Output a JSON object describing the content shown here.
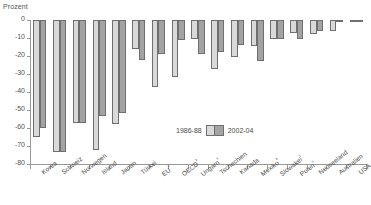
{
  "axis_title": "Prozent",
  "legend": {
    "series1_label": "1986-88",
    "series2_label": "2002-04",
    "series1_color": "#d9d9d9",
    "series2_color": "#a3a3a3"
  },
  "chart_data": {
    "type": "bar",
    "title": "",
    "subtitle": "",
    "xlabel": "",
    "ylabel": "Prozent",
    "ylim": [
      -80,
      0
    ],
    "ytick_labels": [
      "0",
      "-10",
      "-20",
      "-30",
      "-40",
      "-50",
      "-60",
      "-70",
      "-80"
    ],
    "ytick_values": [
      0,
      -10,
      -20,
      -30,
      -40,
      -50,
      -60,
      -70,
      -80
    ],
    "grid": false,
    "legend_position": "inside-bottom-center",
    "categories": [
      "Korea",
      "Schweiz",
      "Norwegen",
      "Island",
      "Japan",
      "Türkei",
      "EU ²",
      "OECD ³",
      "Ungarn ¹",
      "Tschechien",
      "Kanada",
      "Mexiko ³",
      "Slowakei ¹",
      "Polen ¹",
      "Neuseeland",
      "Australien",
      "USA"
    ],
    "series": [
      {
        "name": "1986-88",
        "color": "#d9d9d9",
        "values": [
          -65,
          -73.5,
          -57,
          -72,
          -57.5,
          -16,
          -37,
          -31.5,
          -10.5,
          -27,
          -20.5,
          -14.5,
          -10.5,
          -7,
          -8,
          -6,
          -1
        ]
      },
      {
        "name": "2002-04",
        "color": "#a3a3a3",
        "values": [
          -60,
          -73.5,
          -57,
          -53.5,
          -51.5,
          -22,
          -19,
          -11,
          -19,
          -17.5,
          -14,
          -22.5,
          -10.5,
          -10.5,
          -6,
          -1,
          -0.5
        ]
      }
    ]
  }
}
